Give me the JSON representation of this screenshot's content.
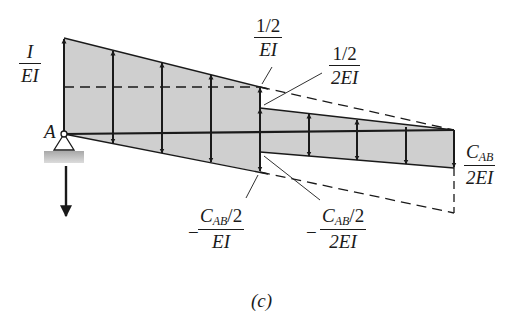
{
  "figure": {
    "caption": "(c)",
    "point_label": "A",
    "colors": {
      "fill": "#cfcfcf",
      "line": "#1a1a1a",
      "support_base": "#b8b8b8"
    }
  },
  "labels": {
    "left_top": {
      "num": "I",
      "den": "EI"
    },
    "mid_top": {
      "num": "1/2",
      "den": "EI"
    },
    "mid_top_right": {
      "num": "1/2",
      "den": "2EI"
    },
    "right_end": {
      "num_main": "C",
      "num_sub": "AB",
      "den": "2EI"
    },
    "mid_bottom_left": {
      "sign": "−",
      "num_main": "C",
      "num_sub": "AB",
      "num_tail": "/2",
      "den": "EI"
    },
    "mid_bottom_right": {
      "sign": "−",
      "num_main": "C",
      "num_sub": "AB",
      "num_tail": "/2",
      "den": "2EI"
    }
  },
  "diagram": {
    "type": "conjugate-beam M/EI diagram",
    "left_section": {
      "x_start": 64,
      "x_end": 260,
      "top": [
        38,
        87
      ],
      "bottom": [
        134,
        172
      ]
    },
    "right_section": {
      "x_start": 260,
      "x_end": 454,
      "top": [
        108,
        130
      ],
      "bottom": [
        152,
        168
      ]
    },
    "left_arrows_x": [
      113,
      162,
      211
    ],
    "right_arrows_x": [
      309,
      357,
      406
    ]
  }
}
